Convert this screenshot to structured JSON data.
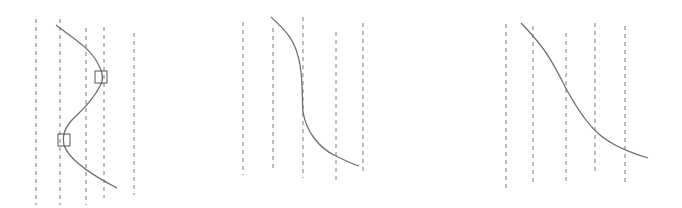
{
  "diagram": {
    "panels": [
      {
        "id": "panel-1",
        "description": "S-shaped curve oscillating across dashed vertical lines with two square markers at turning points",
        "dashed_lines": [
          {
            "x": 36,
            "y1": 19,
            "y2": 205
          },
          {
            "x": 60,
            "y1": 19,
            "y2": 205
          },
          {
            "x": 86,
            "y1": 28,
            "y2": 205
          },
          {
            "x": 104,
            "y1": 27,
            "y2": 198
          },
          {
            "x": 134,
            "y1": 33,
            "y2": 195
          }
        ],
        "curve_path": "M56,25 C70,36 90,48 97,62 C103,72 104,80 100,86 C92,102 80,112 72,120 C65,128 62,135 64,145 C68,158 90,174 117,188",
        "markers": [
          {
            "shape": "square",
            "x": 95,
            "y": 71,
            "size": 12
          },
          {
            "shape": "square",
            "x": 58,
            "y": 134,
            "size": 12
          }
        ]
      },
      {
        "id": "panel-2",
        "description": "Steep descending curve with near-vertical section across dashed lines",
        "dashed_lines": [
          {
            "x": 243,
            "y1": 22,
            "y2": 175
          },
          {
            "x": 273,
            "y1": 28,
            "y2": 170
          },
          {
            "x": 303,
            "y1": 17,
            "y2": 178
          },
          {
            "x": 336,
            "y1": 32,
            "y2": 180
          },
          {
            "x": 363,
            "y1": 23,
            "y2": 173
          }
        ],
        "curve_path": "M271,17 C285,30 296,40 300,65 C303,82 302,100 303,112 C306,130 318,148 336,156 C344,160 352,164 359,166",
        "markers": []
      },
      {
        "id": "panel-3",
        "description": "Smooth sigmoid-like descending curve across dashed lines",
        "dashed_lines": [
          {
            "x": 506,
            "y1": 24,
            "y2": 190
          },
          {
            "x": 533,
            "y1": 26,
            "y2": 185
          },
          {
            "x": 566,
            "y1": 33,
            "y2": 185
          },
          {
            "x": 595,
            "y1": 23,
            "y2": 172
          },
          {
            "x": 625,
            "y1": 26,
            "y2": 183
          }
        ],
        "curve_path": "M521,23 C528,30 533,36 538,42 C552,58 560,78 568,92 C578,110 588,125 600,135 C612,145 628,152 648,158",
        "markers": []
      }
    ]
  }
}
